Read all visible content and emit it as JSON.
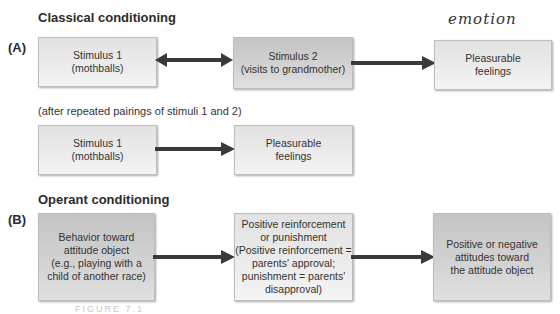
{
  "section_a": {
    "heading": "Classical conditioning",
    "label": "(A)",
    "row1": {
      "box1": "Stimulus 1\n(mothballs)",
      "box2": "Stimulus 2\n(visits to grandmother)",
      "box3": "Pleasurable\nfeelings"
    },
    "note": "(after repeated pairings of stimuli 1 and 2)",
    "row2": {
      "box1": "Stimulus 1\n(mothballs)",
      "box2": "Pleasurable\nfeelings"
    },
    "handwritten_annotation": "emotion"
  },
  "section_b": {
    "heading": "Operant conditioning",
    "label": "(B)",
    "box1": "Behavior toward\nattitude object\n(e.g., playing with a\nchild of another race)",
    "box2": "Positive reinforcement\nor punishment\n(Positive reinforcement =\nparents' approval;\npunishment = parents'\ndisapproval)",
    "box3": "Positive or negative\nattitudes toward\nthe attitude object"
  },
  "caption": "FIGURE 7.1",
  "colors": {
    "arrow": "#3a3a3a",
    "box_light": "#e8e8e8",
    "box_dark": "#cccccc"
  }
}
